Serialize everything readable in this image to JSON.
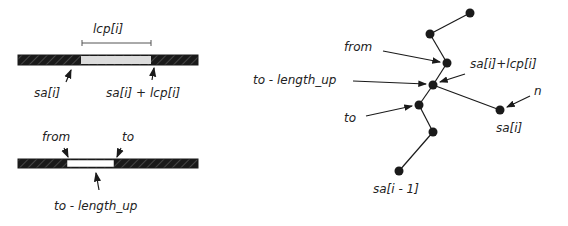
{
  "left_diagram": {
    "top_bar": {
      "span_label": "lcp[i]",
      "start_label": "sa[i]",
      "end_label": "sa[i] + lcp[i]"
    },
    "bottom_bar": {
      "from_label": "from",
      "to_label": "to",
      "below_label": "to - length_up"
    }
  },
  "right_diagram": {
    "labels": {
      "from": "from",
      "to_length_up": "to - length_up",
      "to": "to",
      "sa_plus_lcp": "sa[i]+lcp[i]",
      "n": "n",
      "sa_i": "sa[i]",
      "sa_i_minus_1": "sa[i - 1]"
    }
  },
  "colors": {
    "ink": "#1a1a1a",
    "highlight_top": "#dcdcdc",
    "highlight_bottom": "#ffffff"
  }
}
